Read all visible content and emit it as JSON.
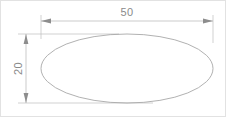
{
  "drawing": {
    "title": "Ellipse with width and height dimensions",
    "background_color": "#ffffff",
    "border_color": "#e2e2e2",
    "line_color": "#a8a8a8",
    "dimension_line_color": "#b5b5b5",
    "extension_line_color": "#bdbdbd",
    "arrow_color": "#8d8d8d",
    "text_color": "#8a8a8a",
    "canvas": {
      "width": 226,
      "height": 117
    },
    "shape": {
      "name": "ellipse",
      "center_x": 126,
      "center_y": 67.5,
      "radius_x": 86,
      "radius_y": 34.5,
      "fill": "none"
    },
    "dimensions": [
      {
        "id": "width",
        "label": "50",
        "orientation": "horizontal",
        "line_y": 20,
        "start_x": 40,
        "end_x": 212,
        "text_x": 126,
        "text_y": 15,
        "rotation": 0
      },
      {
        "id": "height",
        "label": "20",
        "orientation": "vertical",
        "line_x": 25,
        "start_y": 33,
        "end_y": 102,
        "text_x": 17,
        "text_y": 67.5,
        "rotation": -90
      }
    ]
  }
}
